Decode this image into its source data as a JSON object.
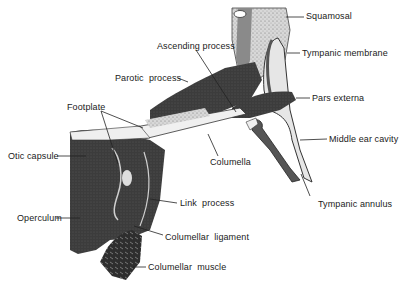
{
  "figure": {
    "labels": [
      {
        "id": "squamosal",
        "text": "Squamosal",
        "x": 306,
        "y": 11
      },
      {
        "id": "tympanic-membrane",
        "text": "Tympanic membrane",
        "x": 302,
        "y": 48
      },
      {
        "id": "ascending-process",
        "text": "Ascending process",
        "x": 157,
        "y": 41
      },
      {
        "id": "parotic-process",
        "text": "Parotic  process",
        "x": 115,
        "y": 73
      },
      {
        "id": "pars-externa",
        "text": "Pars externa",
        "x": 312,
        "y": 93
      },
      {
        "id": "footplate",
        "text": "Footplate",
        "x": 67,
        "y": 102
      },
      {
        "id": "middle-ear-cavity",
        "text": "Middle ear cavity",
        "x": 329,
        "y": 134
      },
      {
        "id": "otic-capsule",
        "text": "Otic capsule",
        "x": 8,
        "y": 151
      },
      {
        "id": "columella",
        "text": "Columella",
        "x": 210,
        "y": 157
      },
      {
        "id": "tympanic-annulus",
        "text": "Tympanic annulus",
        "x": 318,
        "y": 199
      },
      {
        "id": "link-process",
        "text": "Link  process",
        "x": 180,
        "y": 198
      },
      {
        "id": "operculum",
        "text": "Operculum",
        "x": 17,
        "y": 213
      },
      {
        "id": "columellar-ligament",
        "text": "Columellar  ligament",
        "x": 165,
        "y": 232
      },
      {
        "id": "columellar-muscle",
        "text": "Columellar  muscle",
        "x": 148,
        "y": 262
      }
    ],
    "colors": {
      "dark_tissue": "#3a3a3a",
      "medium_tissue": "#6b6b6b",
      "light_tissue": "#bdbdbd",
      "line": "#222222",
      "background": "#ffffff"
    }
  }
}
